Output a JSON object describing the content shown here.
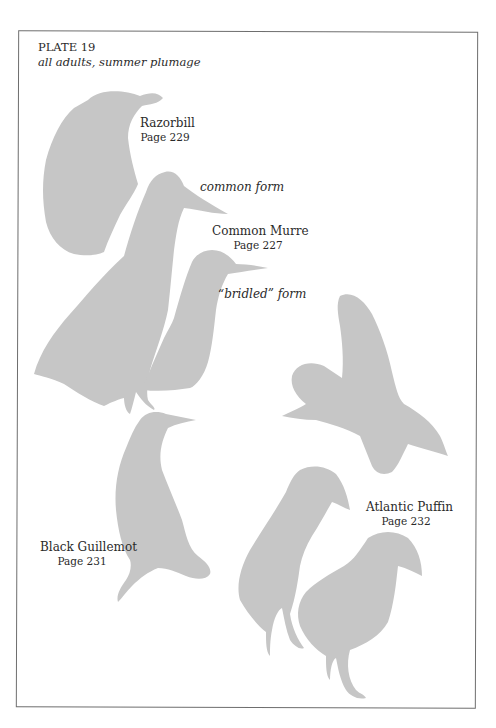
{
  "plate": {
    "number": "PLATE 19",
    "subtitle": "all adults, summer plumage"
  },
  "species": [
    {
      "name": "Razorbill",
      "page": "Page 229"
    },
    {
      "name": "Common Murre",
      "page": "Page 227",
      "forms": [
        "common form",
        "“bridled” form"
      ]
    },
    {
      "name": "Black Guillemot",
      "page": "Page 231"
    },
    {
      "name": "Atlantic Puffin",
      "page": "Page 232"
    }
  ],
  "colors": {
    "silhouette": "#c6c6c6",
    "frame": "#6e6e6e",
    "text": "#2a2a2a",
    "background": "#ffffff"
  }
}
